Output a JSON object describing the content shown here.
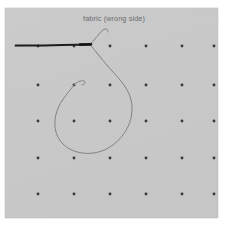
{
  "figure": {
    "caption_label": "fabric (wrong side)",
    "background_color": "#ffffff",
    "fabric": {
      "name": "fabric-panel",
      "color": "#c9c9c9",
      "edge_color": "#bdbdbd",
      "x": 5,
      "y": 8,
      "width": 213,
      "height": 210
    },
    "grid": {
      "dot_color": "#3a3a3a",
      "dot_radius": 1.45,
      "columns": 6,
      "rows": 5,
      "start_x": 38,
      "start_y": 46,
      "step_x": 36,
      "step_y": 36,
      "dots": [
        {
          "x": 38,
          "y": 46
        },
        {
          "x": 74,
          "y": 46
        },
        {
          "x": 110,
          "y": 46
        },
        {
          "x": 146,
          "y": 46
        },
        {
          "x": 182,
          "y": 46
        },
        {
          "x": 214,
          "y": 46
        },
        {
          "x": 38,
          "y": 85
        },
        {
          "x": 74,
          "y": 85
        },
        {
          "x": 110,
          "y": 85
        },
        {
          "x": 146,
          "y": 85
        },
        {
          "x": 182,
          "y": 85
        },
        {
          "x": 214,
          "y": 85
        },
        {
          "x": 38,
          "y": 121
        },
        {
          "x": 74,
          "y": 121
        },
        {
          "x": 110,
          "y": 121
        },
        {
          "x": 146,
          "y": 121
        },
        {
          "x": 182,
          "y": 121
        },
        {
          "x": 214,
          "y": 121
        },
        {
          "x": 38,
          "y": 158
        },
        {
          "x": 74,
          "y": 158
        },
        {
          "x": 110,
          "y": 158
        },
        {
          "x": 146,
          "y": 158
        },
        {
          "x": 182,
          "y": 158
        },
        {
          "x": 214,
          "y": 158
        },
        {
          "x": 38,
          "y": 194
        },
        {
          "x": 74,
          "y": 194
        },
        {
          "x": 110,
          "y": 194
        },
        {
          "x": 146,
          "y": 194
        },
        {
          "x": 182,
          "y": 194
        },
        {
          "x": 214,
          "y": 194
        }
      ]
    },
    "label_position": {
      "x": 114,
      "y": 21
    },
    "needle": {
      "name": "sewing-needle",
      "color": "#1d1d1d",
      "tip_x": 15,
      "eye_x": 91,
      "y": 45,
      "shaft_path": "M 15 45.6 L 44 45.4 L 62 45.0 L 91 44.4",
      "shaft_width": 2.0,
      "tip_path": "M 15 45.6 L 34 45.5",
      "tip_width": 0.9,
      "eye_path": "M 80 44.6 L 91 44.3",
      "eye_width": 2.6
    },
    "thread": {
      "name": "thread",
      "color": "#7d7d7d",
      "width": 0.95,
      "tail_path": "M 90 44.2 C 95 40 99 33 103 30 C 106 28 108 29 108 32",
      "loop_path": "M 91 45.5 C 96 52 101 58 106 64 C 116 76 128 86 131 100 C 135 117 127 136 110 147 C 94 157 73 155 62 143 C 52 132 53 114 62 101 C 67 93 72 88 74 85",
      "hook_path": "M 74 85 C 77 82 81 80 84 81 C 86 82 85 85 82 85"
    }
  }
}
